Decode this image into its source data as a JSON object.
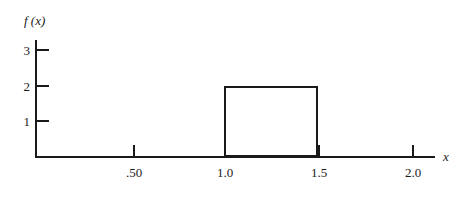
{
  "chart_data": {
    "type": "bar",
    "title": "",
    "subtitle": "",
    "xlabel": "x",
    "ylabel": "f (x)",
    "grid": false,
    "legend": null,
    "xlim": [
      0,
      2.18
    ],
    "ylim": [
      0,
      3.3
    ],
    "x_ticks": [
      {
        "value": 0.5,
        "label": ".50"
      },
      {
        "value": 1.0,
        "label": "1.0"
      },
      {
        "value": 1.5,
        "label": "1.5"
      },
      {
        "value": 2.0,
        "label": "2.0"
      }
    ],
    "y_ticks": [
      {
        "value": 1,
        "label": "1"
      },
      {
        "value": 2,
        "label": "2"
      },
      {
        "value": 3,
        "label": "3"
      }
    ],
    "series": [
      {
        "name": "f(x)",
        "kind": "uniform-density-rectangle",
        "bars": [
          {
            "x_start": 1.0,
            "x_end": 1.5,
            "height": 2
          }
        ]
      }
    ],
    "annotations": []
  },
  "figure": {
    "x_axis_title": "x",
    "y_axis_title": "f (x)"
  }
}
